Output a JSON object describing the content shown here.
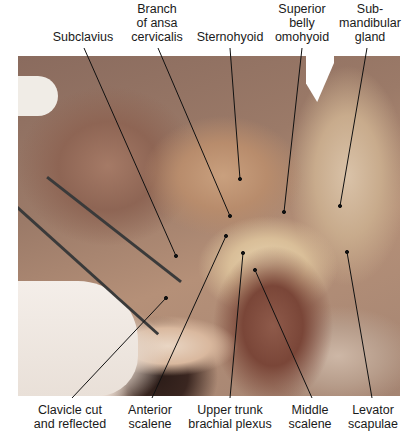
{
  "figure": {
    "type": "anatomical dissection photograph",
    "photo_region": {
      "left": 18,
      "top": 56,
      "width": 382,
      "height": 340
    },
    "labels_top": [
      {
        "id": "subclavius",
        "lines": [
          "Subclavius"
        ],
        "x": 83,
        "y": 30,
        "leader": {
          "x1": 84,
          "y1": 48,
          "x2": 176,
          "y2": 256
        }
      },
      {
        "id": "branch-ansa-cervicalis",
        "lines": [
          "Branch",
          "of ansa",
          "cervicalis"
        ],
        "x": 157,
        "y": 2,
        "leader": {
          "x1": 158,
          "y1": 48,
          "x2": 230,
          "y2": 216
        }
      },
      {
        "id": "sternohyoid",
        "lines": [
          "Sternohyoid"
        ],
        "x": 230,
        "y": 30,
        "leader": {
          "x1": 230,
          "y1": 48,
          "x2": 240,
          "y2": 179
        }
      },
      {
        "id": "superior-belly-omohyoid",
        "lines": [
          "Superior",
          "belly",
          "omohyoid"
        ],
        "x": 302,
        "y": 2,
        "leader": {
          "x1": 302,
          "y1": 48,
          "x2": 284,
          "y2": 212
        }
      },
      {
        "id": "submandibular-gland",
        "lines": [
          "Sub-",
          "mandibular",
          "gland"
        ],
        "x": 370,
        "y": 2,
        "leader": {
          "x1": 367,
          "y1": 48,
          "x2": 340,
          "y2": 206
        }
      }
    ],
    "labels_bottom": [
      {
        "id": "clavicle-cut-reflected",
        "lines": [
          "Clavicle cut",
          "and reflected"
        ],
        "x": 70,
        "y": 403,
        "leader": {
          "x1": 72,
          "y1": 398,
          "x2": 166,
          "y2": 298
        }
      },
      {
        "id": "anterior-scalene",
        "lines": [
          "Anterior",
          "scalene"
        ],
        "x": 150,
        "y": 403,
        "leader": {
          "x1": 152,
          "y1": 398,
          "x2": 226,
          "y2": 236
        }
      },
      {
        "id": "upper-trunk-brachial-plexus",
        "lines": [
          "Upper trunk",
          "brachial plexus"
        ],
        "x": 230,
        "y": 403,
        "leader": {
          "x1": 230,
          "y1": 398,
          "x2": 243,
          "y2": 253
        }
      },
      {
        "id": "middle-scalene",
        "lines": [
          "Middle",
          "scalene"
        ],
        "x": 310,
        "y": 403,
        "leader": {
          "x1": 312,
          "y1": 398,
          "x2": 255,
          "y2": 270
        }
      },
      {
        "id": "levator-scapulae",
        "lines": [
          "Levator",
          "scapulae"
        ],
        "x": 373,
        "y": 403,
        "leader": {
          "x1": 372,
          "y1": 398,
          "x2": 347,
          "y2": 252
        }
      }
    ]
  },
  "colors": {
    "label_text": "#1a1a1a",
    "leader_line": "#111111",
    "background": "#ffffff"
  }
}
